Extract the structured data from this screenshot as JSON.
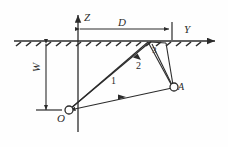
{
  "figure": {
    "kind": "ray-path-diagram",
    "stroke_color": "#2b2b2b",
    "background": "#fefefe"
  },
  "axes": {
    "vertical": {
      "label": "Z",
      "direction": "up",
      "name": "z-axis"
    },
    "horizontal": {
      "label": "Y",
      "direction": "right",
      "name": "y-axis"
    }
  },
  "dimensions": {
    "horizontal": {
      "label": "D",
      "description": "horizontal offset along surface"
    },
    "vertical": {
      "label": "W",
      "description": "source depth below surface"
    }
  },
  "points": [
    {
      "id": "origin",
      "label": "O",
      "name": "point-o"
    },
    {
      "id": "receiver",
      "label": "A",
      "name": "point-a"
    }
  ],
  "rays": [
    {
      "label": "1",
      "name": "ray-1",
      "description": "direct path between O and A"
    },
    {
      "label": "2",
      "name": "ray-2",
      "description": "surface reflected path"
    },
    {
      "label": "3",
      "name": "ray-3",
      "description": "second surface reflected path"
    }
  ],
  "surface": {
    "name": "ground-surface",
    "hatching": true
  }
}
